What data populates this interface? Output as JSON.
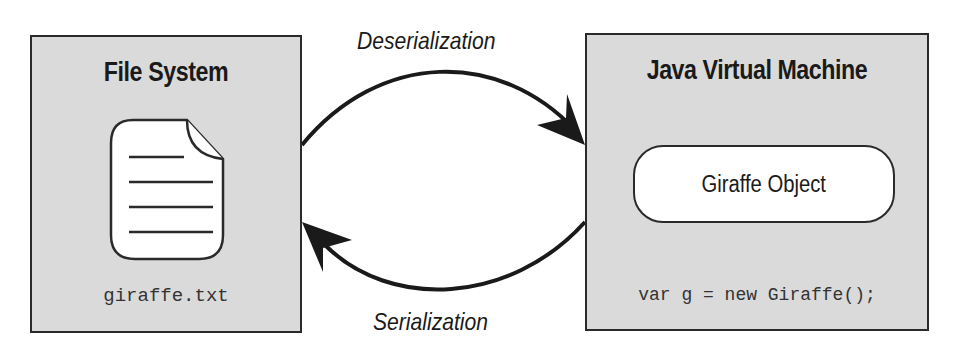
{
  "left_box": {
    "title": "File System",
    "file_label": "giraffe.txt",
    "icon": "document-icon"
  },
  "right_box": {
    "title": "Java Virtual Machine",
    "object_label": "Giraffe Object",
    "code": "var g = new Giraffe();"
  },
  "arrows": {
    "top_label": "Deserialization",
    "top_direction": "File System -> Java Virtual Machine",
    "bottom_label": "Serialization",
    "bottom_direction": "Java Virtual Machine -> File System"
  },
  "colors": {
    "box_fill": "#dadada",
    "stroke": "#2a2a2a",
    "background": "#ffffff"
  }
}
